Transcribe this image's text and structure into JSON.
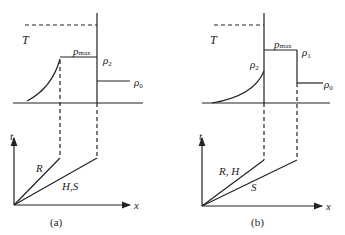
{
  "figure": {
    "panels": [
      {
        "id": "a",
        "caption": "(a)",
        "profile": {
          "T_label": "T",
          "pmax_label": "p",
          "pmax_sub": "max",
          "rho_right_label": "ρ",
          "rho_right_sub": "2",
          "rho0_label": "ρ",
          "rho0_sub": "0"
        },
        "xt": {
          "t_axis": "t",
          "x_axis": "x",
          "line1_label": "R",
          "line2_label": "H,S"
        }
      },
      {
        "id": "b",
        "caption": "(b)",
        "profile": {
          "T_label": "T",
          "pmax_label": "p",
          "pmax_sub": "max",
          "rho_left_label": "ρ",
          "rho_left_sub": "2",
          "rho_right_label": "ρ",
          "rho_right_sub": "1",
          "rho0_label": "ρ",
          "rho0_sub": "0"
        },
        "xt": {
          "t_axis": "t",
          "x_axis": "x",
          "line1_label": "R, H",
          "line2_label": "S"
        }
      }
    ],
    "colors": {
      "ink": "#222222",
      "background": "#ffffff"
    }
  }
}
